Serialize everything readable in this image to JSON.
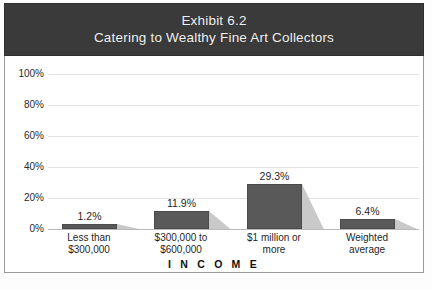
{
  "figure": {
    "title_line1": "Exhibit 6.2",
    "title_line2": "Catering to Wealthy Fine Art Collectors",
    "header_bg": "#3a3a3a",
    "header_text_color": "#f2f2f2",
    "frame_border": "#9a9a9a"
  },
  "chart_data": {
    "type": "bar",
    "categories": [
      "Less than $300,000",
      "$300,000 to $600,000",
      "$1 million or more",
      "Weighted average"
    ],
    "category_lines": [
      [
        "Less than",
        "$300,000"
      ],
      [
        "$300,000 to",
        "$600,000"
      ],
      [
        "$1 million or",
        "more"
      ],
      [
        "Weighted",
        "average"
      ]
    ],
    "values": [
      1.2,
      11.9,
      29.3,
      6.4
    ],
    "value_labels": [
      "1.2%",
      "11.9%",
      "29.3%",
      "6.4%"
    ],
    "xlabel": "INCOME",
    "xlabel_display": "I N C O M E",
    "ylabel": "",
    "ylim": [
      0,
      100
    ],
    "ytick_values": [
      0,
      20,
      40,
      60,
      80,
      100
    ],
    "ytick_labels": [
      "0%",
      "20%",
      "40%",
      "60%",
      "80%",
      "100%"
    ],
    "grid": true,
    "legend": false,
    "bar_color": "#595959",
    "bar_shadow_color": "#c9c9c9",
    "gridline_color": "#e3e3e3",
    "baseline_color": "#b9b9b9"
  }
}
